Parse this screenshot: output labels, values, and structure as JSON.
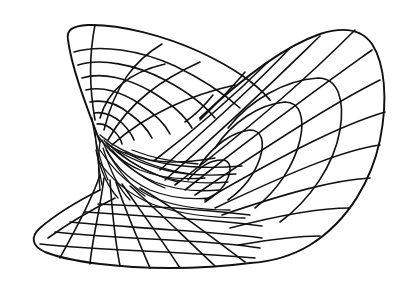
{
  "figure": {
    "colors": {
      "background": "#ffffff",
      "line": "#111111"
    },
    "regions": [
      {
        "name": "upper-left-lobe",
        "label": "Upper-left lobe"
      },
      {
        "name": "right-lobe",
        "label": "Right lobe"
      },
      {
        "name": "lower-left-lobe",
        "label": "Lower-left flared lobe"
      },
      {
        "name": "pinch-region",
        "label": "Pinch / convergence region"
      }
    ]
  }
}
